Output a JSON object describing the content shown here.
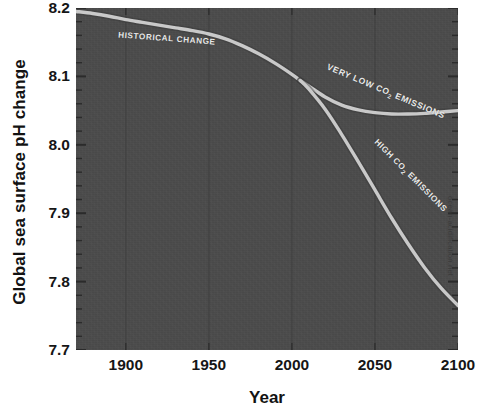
{
  "chart_data": {
    "type": "line",
    "title": "",
    "xlabel": "Year",
    "ylabel": "Global sea surface pH change",
    "xlim": [
      1870,
      2100
    ],
    "ylim": [
      7.7,
      8.2
    ],
    "grid": true,
    "legend_position": "inline-annotations",
    "x_ticks": [
      {
        "value": 1900,
        "label": "1900"
      },
      {
        "value": 1950,
        "label": "1950"
      },
      {
        "value": 2000,
        "label": "2000"
      },
      {
        "value": 2050,
        "label": "2050"
      },
      {
        "value": 2100,
        "label": "2100"
      }
    ],
    "y_ticks": [
      {
        "value": 8.2,
        "label": "8.2"
      },
      {
        "value": 8.1,
        "label": "8.1"
      },
      {
        "value": 8.0,
        "label": "8.0"
      },
      {
        "value": 7.9,
        "label": "7.9"
      },
      {
        "value": 7.8,
        "label": "7.8"
      },
      {
        "value": 7.7,
        "label": "7.7"
      }
    ],
    "y_minor_tick_step": 0.02,
    "series": [
      {
        "name": "HISTORICAL CHANGE",
        "label": "HISTORICAL CHANGE",
        "color": "#c9c9c9",
        "x": [
          1870,
          1880,
          1890,
          1900,
          1910,
          1920,
          1930,
          1940,
          1950,
          1960,
          1970,
          1980,
          1990,
          2000,
          2005
        ],
        "y": [
          8.195,
          8.192,
          8.188,
          8.183,
          8.179,
          8.175,
          8.171,
          8.167,
          8.162,
          8.155,
          8.145,
          8.133,
          8.119,
          8.103,
          8.094
        ]
      },
      {
        "name": "VERY LOW CO2 EMISSIONS",
        "label_prefix": "VERY LOW CO",
        "label_sub": "2",
        "label_suffix": " EMISSIONS",
        "color": "#c9c9c9",
        "x": [
          2005,
          2010,
          2020,
          2030,
          2040,
          2050,
          2060,
          2070,
          2080,
          2090,
          2100
        ],
        "y": [
          8.094,
          8.086,
          8.07,
          8.058,
          8.051,
          8.047,
          8.045,
          8.045,
          8.046,
          8.048,
          8.05
        ]
      },
      {
        "name": "HIGH CO2 EMISSIONS",
        "label_prefix": "HIGH CO",
        "label_sub": "2",
        "label_suffix": " EMISSIONS",
        "color": "#c9c9c9",
        "x": [
          2005,
          2010,
          2020,
          2030,
          2040,
          2050,
          2060,
          2070,
          2080,
          2090,
          2100
        ],
        "y": [
          8.094,
          8.082,
          8.052,
          8.015,
          7.975,
          7.934,
          7.893,
          7.855,
          7.82,
          7.79,
          7.765
        ]
      }
    ]
  },
  "axes": {
    "y_title": "Global sea surface pH change",
    "x_title": "Year"
  },
  "annotations": {
    "historical": "HISTORICAL CHANGE",
    "very_low_prefix": "VERY LOW CO",
    "very_low_sub": "2",
    "very_low_suffix": " EMISSIONS",
    "high_prefix": "HIGH CO",
    "high_sub": "2",
    "high_suffix": " EMISSIONS"
  },
  "watermark": {
    "text": "ocean-acidification.net"
  },
  "colors": {
    "plot_background": "#4b4b4b",
    "curve": "#c9c9c9",
    "page_background": "#ffffff",
    "text": "#161616"
  }
}
